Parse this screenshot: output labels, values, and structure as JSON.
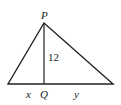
{
  "diagram": {
    "type": "triangle-with-altitude",
    "vertices": {
      "apex": {
        "label": "P"
      },
      "foot": {
        "label": "Q"
      }
    },
    "labels": {
      "apex": "P",
      "foot": "Q",
      "altitude": "12",
      "left_segment": "x",
      "right_segment": "y"
    },
    "colors": {
      "stroke": "#222222",
      "background": "#ffffff"
    }
  }
}
